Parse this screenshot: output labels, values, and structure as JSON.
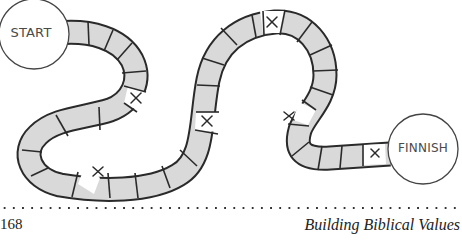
{
  "board": {
    "start_label": "START",
    "finish_label": "FINNISH",
    "space_fill": "#d9d9d9",
    "marked_fill": "#ffffff",
    "outline_color": "#2a2a2a",
    "marked_symbol": "×"
  },
  "footer": {
    "page_number": "168",
    "book_title": "Building Biblical Values"
  }
}
